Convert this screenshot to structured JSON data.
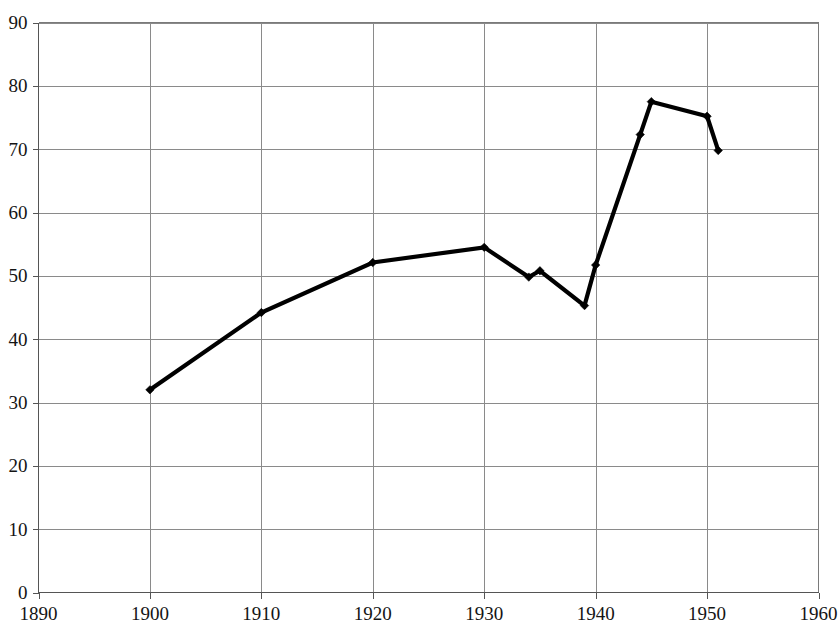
{
  "chart_data": {
    "type": "line",
    "title": "",
    "subtitle": "",
    "xlabel": "",
    "ylabel": "",
    "xlim": [
      1890,
      1960
    ],
    "ylim": [
      0,
      90
    ],
    "grid": true,
    "legend": false,
    "legend_position": "none",
    "marker": "diamond",
    "line_color": "#000000",
    "grid_color": "#8a8a8a",
    "x_ticks": [
      1890,
      1900,
      1910,
      1920,
      1930,
      1940,
      1950,
      1960
    ],
    "x_tick_labels": [
      "1890",
      "1900",
      "1910",
      "1920",
      "1930",
      "1940",
      "1950",
      "1960"
    ],
    "y_ticks": [
      0,
      10,
      20,
      30,
      40,
      50,
      60,
      70,
      80,
      90
    ],
    "y_tick_labels": [
      "0",
      "10",
      "20",
      "30",
      "40",
      "50",
      "60",
      "70",
      "80",
      "90"
    ],
    "series": [
      {
        "name": "series-1",
        "x": [
          1900,
          1910,
          1920,
          1930,
          1934,
          1935,
          1939,
          1940,
          1944,
          1945,
          1950,
          1951
        ],
        "values": [
          32.0,
          44.2,
          52.1,
          54.5,
          49.8,
          50.8,
          45.3,
          51.7,
          72.3,
          77.5,
          75.2,
          69.8
        ]
      }
    ],
    "points": [
      {
        "x": 1900,
        "y": 32.0
      },
      {
        "x": 1910,
        "y": 44.2
      },
      {
        "x": 1920,
        "y": 52.1
      },
      {
        "x": 1930,
        "y": 54.5
      },
      {
        "x": 1934,
        "y": 49.8
      },
      {
        "x": 1935,
        "y": 50.8
      },
      {
        "x": 1939,
        "y": 45.3
      },
      {
        "x": 1940,
        "y": 51.7
      },
      {
        "x": 1944,
        "y": 72.3
      },
      {
        "x": 1945,
        "y": 77.5
      },
      {
        "x": 1950,
        "y": 75.2
      },
      {
        "x": 1951,
        "y": 69.8
      }
    ]
  }
}
